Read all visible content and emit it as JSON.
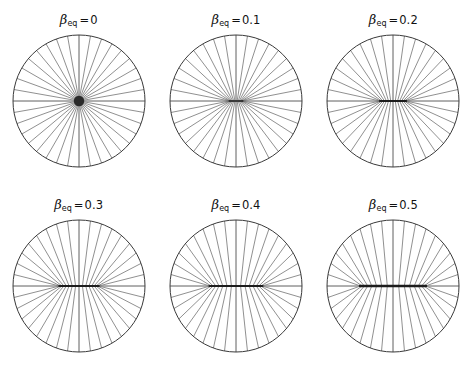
{
  "figure": {
    "background": "#ffffff",
    "line_color": "#4a4a4a",
    "rim_color": "#3a3a3a",
    "axis_color": "#8a8a8a",
    "focus_color": "#1c1c1c",
    "rows": 2,
    "cols": 3
  },
  "panels": [
    {
      "id": "panel-beta-0",
      "symbol": "β",
      "subscript": "eq",
      "equals": "=",
      "value": "0",
      "beta": 0.0
    },
    {
      "id": "panel-beta-0p1",
      "symbol": "β",
      "subscript": "eq",
      "equals": "=",
      "value": "0.1",
      "beta": 0.1
    },
    {
      "id": "panel-beta-0p2",
      "symbol": "β",
      "subscript": "eq",
      "equals": "=",
      "value": "0.2",
      "beta": 0.2
    },
    {
      "id": "panel-beta-0p3",
      "symbol": "β",
      "subscript": "eq",
      "equals": "=",
      "value": "0.3",
      "beta": 0.3
    },
    {
      "id": "panel-beta-0p4",
      "symbol": "β",
      "subscript": "eq",
      "equals": "=",
      "value": "0.4",
      "beta": 0.4
    },
    {
      "id": "panel-beta-0p5",
      "symbol": "β",
      "subscript": "eq",
      "equals": "=",
      "value": "0.5",
      "beta": 0.5
    }
  ],
  "chart_data": {
    "type": "line",
    "title": "",
    "subtitle": "",
    "xlabel": "",
    "ylabel": "",
    "grid": false,
    "legend": "none",
    "panel_titles": [
      "βeq = 0",
      "βeq = 0.1",
      "βeq = 0.2",
      "βeq = 0.3",
      "βeq = 0.4",
      "βeq = 0.5"
    ],
    "series": [
      {
        "name": "βeq = 0",
        "beta_eq": 0.0,
        "n_spokes": 36,
        "circle_radius": 1.0,
        "focus_half_width": 0.0
      },
      {
        "name": "βeq = 0.1",
        "beta_eq": 0.1,
        "n_spokes": 36,
        "circle_radius": 1.0,
        "focus_half_width": 0.1
      },
      {
        "name": "βeq = 0.2",
        "beta_eq": 0.2,
        "n_spokes": 36,
        "circle_radius": 1.0,
        "focus_half_width": 0.2
      },
      {
        "name": "βeq = 0.3",
        "beta_eq": 0.3,
        "n_spokes": 36,
        "circle_radius": 1.0,
        "focus_half_width": 0.3
      },
      {
        "name": "βeq = 0.4",
        "beta_eq": 0.4,
        "n_spokes": 36,
        "circle_radius": 1.0,
        "focus_half_width": 0.4
      },
      {
        "name": "βeq = 0.5",
        "beta_eq": 0.5,
        "n_spokes": 36,
        "circle_radius": 1.0,
        "focus_half_width": 0.5
      }
    ],
    "categories": [
      "0",
      "0.1",
      "0.2",
      "0.3",
      "0.4",
      "0.5"
    ],
    "values": [
      0.0,
      0.1,
      0.2,
      0.3,
      0.4,
      0.5
    ],
    "xlim": [
      -1,
      1
    ],
    "ylim": [
      -1,
      1
    ]
  }
}
